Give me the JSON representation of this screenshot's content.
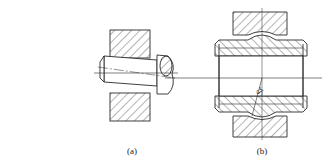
{
  "figure": {
    "panels": [
      {
        "id": "a",
        "label": "(a)",
        "description": "tilted pin in hatched housing"
      },
      {
        "id": "b",
        "label": "(b)",
        "description": "spherical sleeve in hatched housing"
      }
    ],
    "annotations": {
      "sphere_radius": "Sr"
    },
    "colors": {
      "line": "#2a2a2a",
      "hatch": "#444444",
      "background": "#ffffff"
    }
  }
}
